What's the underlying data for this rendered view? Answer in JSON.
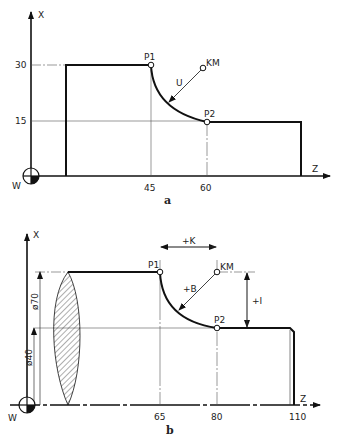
{
  "diagram_a": {
    "caption": "a",
    "x_axis_label": "X",
    "z_axis_label": "Z",
    "origin_label": "W",
    "x_ticks": [
      "30",
      "15"
    ],
    "z_ticks": [
      "45",
      "60"
    ],
    "points": {
      "p1": "P1",
      "p2": "P2",
      "km": "KM"
    },
    "radius_label": "U"
  },
  "diagram_b": {
    "caption": "b",
    "x_axis_label": "X",
    "z_axis_label": "Z",
    "origin_label": "W",
    "z_ticks": [
      "65",
      "80",
      "110"
    ],
    "diameter_labels": [
      "ø70",
      "ø40"
    ],
    "points": {
      "p1": "P1",
      "p2": "P2",
      "km": "KM"
    },
    "dim_k": "+K",
    "dim_i": "+I",
    "radius_label": "+B"
  }
}
